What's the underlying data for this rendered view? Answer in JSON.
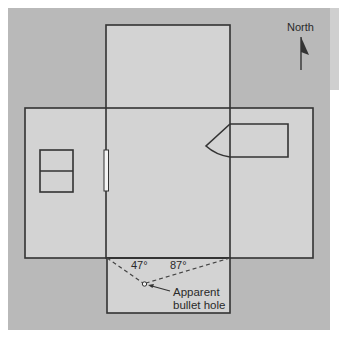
{
  "diagram": {
    "type": "floor-plan",
    "compass": {
      "label": "North",
      "icon": "north-arrow-icon"
    },
    "angles": [
      {
        "label": "47°"
      },
      {
        "label": "87°"
      }
    ],
    "annotation": {
      "line1": "Apparent",
      "line2": "bullet hole"
    },
    "colors": {
      "background": "#b9b9b9",
      "room_fill": "#d3d3d3",
      "wall_stroke": "#333333"
    }
  }
}
